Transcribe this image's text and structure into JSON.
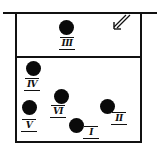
{
  "diagram": {
    "colors": {
      "ink": "#111111",
      "background": "#ffffff"
    },
    "upper_compartment": {
      "balls": [
        {
          "id": "III",
          "label": "III",
          "cx": 67,
          "cy": 28
        }
      ],
      "arrow": {
        "icon": "double-arrow-down-left-icon",
        "direction": "down-left"
      }
    },
    "lower_compartment": {
      "balls": [
        {
          "id": "IV",
          "label": "IV",
          "cx": 33,
          "cy": 68
        },
        {
          "id": "V",
          "label": "V",
          "cx": 30,
          "cy": 108
        },
        {
          "id": "VI",
          "label": "VI",
          "cx": 62,
          "cy": 97
        },
        {
          "id": "I",
          "label": "I",
          "cx": 76,
          "cy": 126
        },
        {
          "id": "II",
          "label": "II",
          "cx": 107,
          "cy": 107
        }
      ]
    }
  }
}
